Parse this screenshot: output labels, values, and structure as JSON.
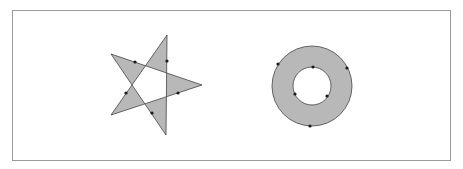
{
  "diagram": {
    "background": "#ffffff",
    "frame": {
      "x": 12.5,
      "y": 10.5,
      "width": 438,
      "height": 150,
      "stroke": "#9a9a9a"
    },
    "fill_color": "#b8b8b8",
    "stroke_color": "#444444",
    "marker_color": "#1a1a1a",
    "shapes": [
      {
        "name": "pentagram",
        "fill_rule": "evenodd",
        "points": [
          [
            167,
            35
          ],
          [
            111,
            115
          ],
          [
            202,
            85
          ],
          [
            111,
            54
          ],
          [
            166,
            135
          ]
        ],
        "markers": [
          [
            135,
            62
          ],
          [
            167,
            61
          ],
          [
            126,
            93
          ],
          [
            152,
            113
          ],
          [
            178,
            93
          ]
        ]
      },
      {
        "name": "annulus",
        "fill_rule": "evenodd",
        "outer": {
          "cx": 312,
          "cy": 86,
          "r": 40
        },
        "inner": {
          "cx": 312,
          "cy": 86,
          "r": 19
        },
        "markers": [
          [
            278,
            64
          ],
          [
            347,
            68
          ],
          [
            310,
            126
          ],
          [
            313,
            67
          ],
          [
            295,
            94
          ],
          [
            327,
            96
          ]
        ]
      }
    ]
  }
}
